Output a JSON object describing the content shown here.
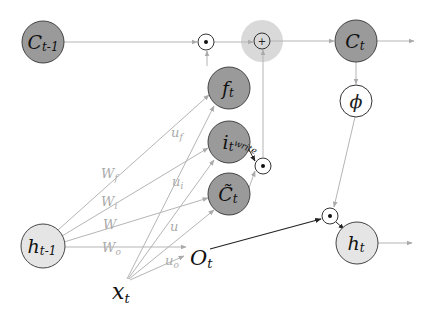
{
  "diagram": {
    "colors": {
      "dark_node": "#9a9a9a",
      "light_node": "#e5e5e5",
      "edge_gray": "#b5b5b5",
      "edge_dark": "#222222",
      "halo": "#d9d9d9"
    },
    "nodes": {
      "c_prev": {
        "main": "C",
        "sub": "t-1"
      },
      "f": {
        "main": "f",
        "sub": "t"
      },
      "i": {
        "main": "i",
        "sub": "t"
      },
      "c_tilde": {
        "main": "C̃",
        "sub": "t"
      },
      "c": {
        "main": "C",
        "sub": "t"
      },
      "phi": {
        "main": "ϕ"
      },
      "h_prev": {
        "main": "h",
        "sub": "t-1"
      },
      "h": {
        "main": "h",
        "sub": "t"
      },
      "o": {
        "main": "O",
        "sub": "t"
      },
      "x": {
        "main": "x",
        "sub": "t"
      }
    },
    "operators": {
      "mult_forget": "⊙",
      "add": "+",
      "mult_write": "⊙",
      "mult_output": "⊙"
    },
    "weight_labels": {
      "wf": {
        "main": "W",
        "sub": "f"
      },
      "wi": {
        "main": "W",
        "sub": "i"
      },
      "w": {
        "main": "W"
      },
      "wo": {
        "main": "W",
        "sub": "o"
      },
      "uf": {
        "main": "u",
        "sub": "f"
      },
      "ui": {
        "main": "u",
        "sub": "i"
      },
      "u": {
        "main": "u"
      },
      "uo": {
        "main": "u",
        "sub": "o"
      }
    },
    "annotations": {
      "write": "write"
    }
  }
}
